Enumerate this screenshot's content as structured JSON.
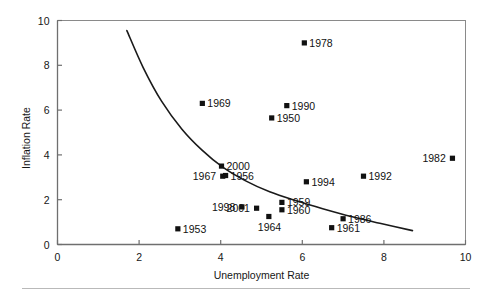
{
  "chart_data": {
    "type": "scatter",
    "title": "",
    "xlabel": "Unemployment Rate",
    "ylabel": "Inflation Rate",
    "xlim": [
      0,
      10
    ],
    "ylim": [
      0,
      10
    ],
    "xticks": [
      0,
      2,
      4,
      6,
      8,
      10
    ],
    "yticks": [
      0,
      2,
      4,
      6,
      8,
      10
    ],
    "xtick_labels": [
      "0",
      "2",
      "4",
      "6",
      "8",
      "10"
    ],
    "ytick_labels": [
      "0",
      "2",
      "4",
      "6",
      "8",
      "10"
    ],
    "grid": false,
    "legend": "none",
    "marker": "filled-square",
    "marker_color": "#111111",
    "line_color": "#1a1a1a",
    "frame_color": "#8a8a8a",
    "points": [
      {
        "label": "1953",
        "x": 2.95,
        "y": 0.7,
        "label_side": "right"
      },
      {
        "label": "1969",
        "x": 3.55,
        "y": 6.3,
        "label_side": "right"
      },
      {
        "label": "2000",
        "x": 4.02,
        "y": 3.5,
        "label_side": "right"
      },
      {
        "label": "1967",
        "x": 4.05,
        "y": 3.05,
        "label_side": "left"
      },
      {
        "label": "1956",
        "x": 4.12,
        "y": 3.08,
        "label_side": "right"
      },
      {
        "label": "1998",
        "x": 4.52,
        "y": 1.68,
        "label_side": "left"
      },
      {
        "label": "2001",
        "x": 4.88,
        "y": 1.62,
        "label_side": "left"
      },
      {
        "label": "1964",
        "x": 5.18,
        "y": 1.25,
        "label_side": "below"
      },
      {
        "label": "1950",
        "x": 5.25,
        "y": 5.65,
        "label_side": "right"
      },
      {
        "label": "1959",
        "x": 5.5,
        "y": 1.88,
        "label_side": "right"
      },
      {
        "label": "1960",
        "x": 5.5,
        "y": 1.55,
        "label_side": "right"
      },
      {
        "label": "1990",
        "x": 5.62,
        "y": 6.2,
        "label_side": "right"
      },
      {
        "label": "1978",
        "x": 6.05,
        "y": 9.0,
        "label_side": "right"
      },
      {
        "label": "1994",
        "x": 6.1,
        "y": 2.8,
        "label_side": "right"
      },
      {
        "label": "1961",
        "x": 6.72,
        "y": 0.75,
        "label_side": "right"
      },
      {
        "label": "1986",
        "x": 7.0,
        "y": 1.15,
        "label_side": "right"
      },
      {
        "label": "1992",
        "x": 7.5,
        "y": 3.05,
        "label_side": "right"
      },
      {
        "label": "1982",
        "x": 9.68,
        "y": 3.85,
        "label_side": "left"
      }
    ],
    "curve": {
      "name": "phillips-curve",
      "points": [
        {
          "x": 1.7,
          "y": 9.55
        },
        {
          "x": 2.1,
          "y": 7.9
        },
        {
          "x": 2.55,
          "y": 6.4
        },
        {
          "x": 3.05,
          "y": 5.15
        },
        {
          "x": 3.55,
          "y": 4.2
        },
        {
          "x": 4.05,
          "y": 3.45
        },
        {
          "x": 4.6,
          "y": 2.85
        },
        {
          "x": 5.2,
          "y": 2.35
        },
        {
          "x": 5.85,
          "y": 1.95
        },
        {
          "x": 6.5,
          "y": 1.6
        },
        {
          "x": 7.2,
          "y": 1.25
        },
        {
          "x": 7.9,
          "y": 0.95
        },
        {
          "x": 8.7,
          "y": 0.62
        }
      ]
    }
  },
  "footer_rule": {
    "visible": true
  }
}
